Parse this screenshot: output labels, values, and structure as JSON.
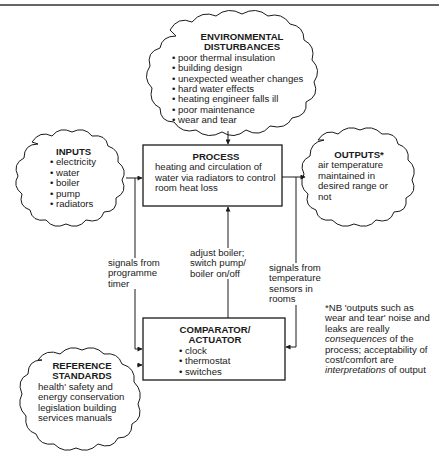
{
  "environmental_disturbances": {
    "title_line1": "ENVIRONMENTAL",
    "title_line2": "DISTURBANCES",
    "items": [
      "poor thermal insulation",
      "building design",
      "unexpected weather changes",
      "hard water effects",
      "heating engineer falls ill",
      "poor maintenance",
      "wear and tear"
    ]
  },
  "inputs": {
    "title": "INPUTS",
    "items": [
      "electricity",
      "water",
      "boiler",
      "pump",
      "radiators"
    ]
  },
  "process": {
    "title": "PROCESS",
    "description": "heating and circulation of water via radiators to control room heat loss"
  },
  "outputs": {
    "title": "OUTPUTS*",
    "description": "air temperature maintained in desired range or not"
  },
  "comparator": {
    "title_line1": "COMPARATOR/",
    "title_line2": "ACTUATOR",
    "items": [
      "clock",
      "thermostat",
      "switches"
    ]
  },
  "reference_standards": {
    "title_line1": "REFERENCE",
    "title_line2": "STANDARDS",
    "description": "health' safety and energy conservation legislation building services manuals"
  },
  "edge_labels": {
    "programme_timer": "signals from programme timer",
    "adjust_boiler": "adjust boiler; switch pump/ boiler on/off",
    "temperature_sensors": "signals from temperature sensors in rooms"
  },
  "note": {
    "part1": "*NB 'outputs such as wear and tear' noise and leaks are really ",
    "em1": "consequences",
    "part2": " of the process; acceptability of cost/comfort are ",
    "em2": "interpretations",
    "part3": " of output"
  },
  "colors": {
    "ink": "#1a1a1a",
    "background": "#ffffff"
  }
}
